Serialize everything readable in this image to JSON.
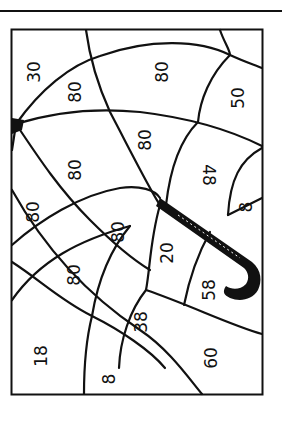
{
  "worksheet": {
    "type": "color-by-number",
    "subject": "umbrella",
    "orientation": "rotated-90-clockwise",
    "colors": {
      "ink": "#111111",
      "paper": "#ffffff"
    },
    "regions": [
      {
        "id": "r1",
        "label": "30",
        "x": 40,
        "y": 72
      },
      {
        "id": "r2",
        "label": "80",
        "x": 76,
        "y": 92
      },
      {
        "id": "r3",
        "label": "80",
        "x": 162,
        "y": 72
      },
      {
        "id": "r4",
        "label": "50",
        "x": 240,
        "y": 98
      },
      {
        "id": "r5",
        "label": "80",
        "x": 76,
        "y": 170
      },
      {
        "id": "r6",
        "label": "80",
        "x": 146,
        "y": 140
      },
      {
        "id": "r7",
        "label": "48",
        "x": 198,
        "y": 175
      },
      {
        "id": "r8",
        "label": "8",
        "x": 247,
        "y": 207
      },
      {
        "id": "r9",
        "label": "80",
        "x": 34,
        "y": 212
      },
      {
        "id": "r10",
        "label": "80",
        "x": 119,
        "y": 232
      },
      {
        "id": "r11",
        "label": "20",
        "x": 168,
        "y": 253
      },
      {
        "id": "r12",
        "label": "80",
        "x": 75,
        "y": 275
      },
      {
        "id": "r13",
        "label": "58",
        "x": 210,
        "y": 290
      },
      {
        "id": "r14",
        "label": "38",
        "x": 142,
        "y": 322
      },
      {
        "id": "r15",
        "label": "18",
        "x": 42,
        "y": 356
      },
      {
        "id": "r16",
        "label": "8",
        "x": 110,
        "y": 379
      },
      {
        "id": "r17",
        "label": "60",
        "x": 212,
        "y": 358
      }
    ]
  }
}
